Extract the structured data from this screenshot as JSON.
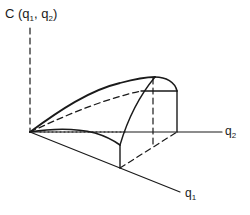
{
  "diagram": {
    "type": "3d-surface-sketch",
    "vertical_axis": {
      "label": "C",
      "args_open": "(q",
      "arg1_sub": "1",
      "sep": ", q",
      "arg2_sub": "2",
      "args_close": ")"
    },
    "axis_q2": {
      "base": "q",
      "sub": "2"
    },
    "axis_q1": {
      "base": "q",
      "sub": "1"
    },
    "colors": {
      "line": "#1a1a1a",
      "background": "#ffffff"
    }
  }
}
